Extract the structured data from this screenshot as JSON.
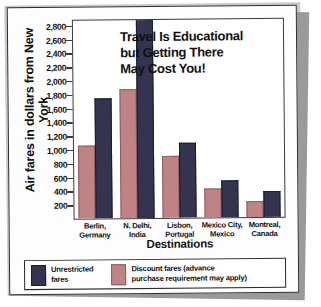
{
  "chart_data": {
    "type": "bar",
    "title_lines": [
      "Travel Is Educational",
      "but Getting There",
      "May Cost You!"
    ],
    "xlabel": "Destinations",
    "ylabel": "Air fares in dollars from New York",
    "ylim": [
      0,
      2900
    ],
    "yticks": [
      200,
      400,
      600,
      800,
      1000,
      1200,
      1400,
      1600,
      1800,
      2000,
      2200,
      2400,
      2600,
      2800
    ],
    "ytick_labels": [
      "200",
      "400",
      "600",
      "800",
      "1,000",
      "1,200",
      "1,400",
      "1,600",
      "1,800",
      "2,000",
      "2,200",
      "2,400",
      "2,600",
      "2,800"
    ],
    "grid": false,
    "legend_position": "bottom",
    "categories": [
      "Berlin, Germany",
      "N. Delhi, India",
      "Lisbon, Portugal",
      "Mexico City, Mexico",
      "Montreal, Canada"
    ],
    "category_lines": [
      [
        "Berlin,",
        "Germany"
      ],
      [
        "N. Delhi,",
        "India"
      ],
      [
        "Lisbon,",
        "Portugal"
      ],
      [
        "Mexico City,",
        "Mexico"
      ],
      [
        "Montreal,",
        "Canada"
      ]
    ],
    "series": [
      {
        "name": "Discount fares (advance purchase requirement may apply)",
        "color": "#bf8386",
        "values": [
          1050,
          1880,
          890,
          410,
          215
        ]
      },
      {
        "name": "Unrestricted fares",
        "color": "#343350",
        "values": [
          1750,
          3000,
          1080,
          530,
          370
        ],
        "notes": "N. Delhi unrestricted bar extends beyond the top of the plot area (off-scale)"
      }
    ]
  },
  "legend": {
    "entries": [
      {
        "label_lines": [
          "Unrestricted",
          "fares"
        ],
        "color": "#343350"
      },
      {
        "label_lines": [
          "Discount fares (advance",
          "purchase requirement may apply)"
        ],
        "color": "#bf8386"
      }
    ]
  }
}
